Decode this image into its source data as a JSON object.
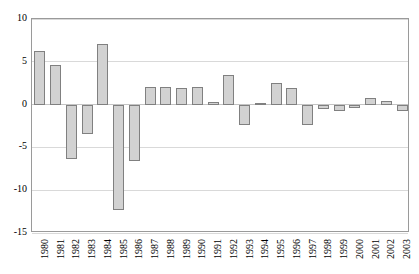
{
  "chart_data": {
    "type": "bar",
    "title": "",
    "subtitle": "",
    "xlabel": "",
    "ylabel": "",
    "categories": [
      "1980",
      "1981",
      "1982",
      "1983",
      "1984",
      "1985",
      "1986",
      "1987",
      "1988",
      "1989",
      "1990",
      "1991",
      "1992",
      "1993",
      "1994",
      "1995",
      "1996",
      "1997",
      "1998",
      "1999",
      "2000",
      "2001",
      "2002",
      "2003"
    ],
    "values": [
      6.3,
      4.6,
      -6.3,
      -3.4,
      7.1,
      -12.3,
      -6.6,
      2.0,
      2.1,
      1.9,
      2.1,
      0.3,
      3.4,
      -2.4,
      0.2,
      2.5,
      1.9,
      -2.4,
      -0.5,
      -0.8,
      -0.4,
      0.8,
      0.4,
      -0.8
    ],
    "ylim": [
      -15,
      10
    ],
    "yticks": [
      10,
      5,
      0,
      -5,
      -10,
      -15
    ],
    "ytick_labels": [
      "10",
      "5",
      "0",
      "-5",
      "-10",
      "-15"
    ],
    "grid": true,
    "legend": false,
    "legend_position": "none",
    "bar_color": "#d2d2d2",
    "bar_border_color": "#808080",
    "gridline_color": "#d9d9d9",
    "axis_color": "#9a9a9a",
    "plot_background": "#ffffff"
  }
}
